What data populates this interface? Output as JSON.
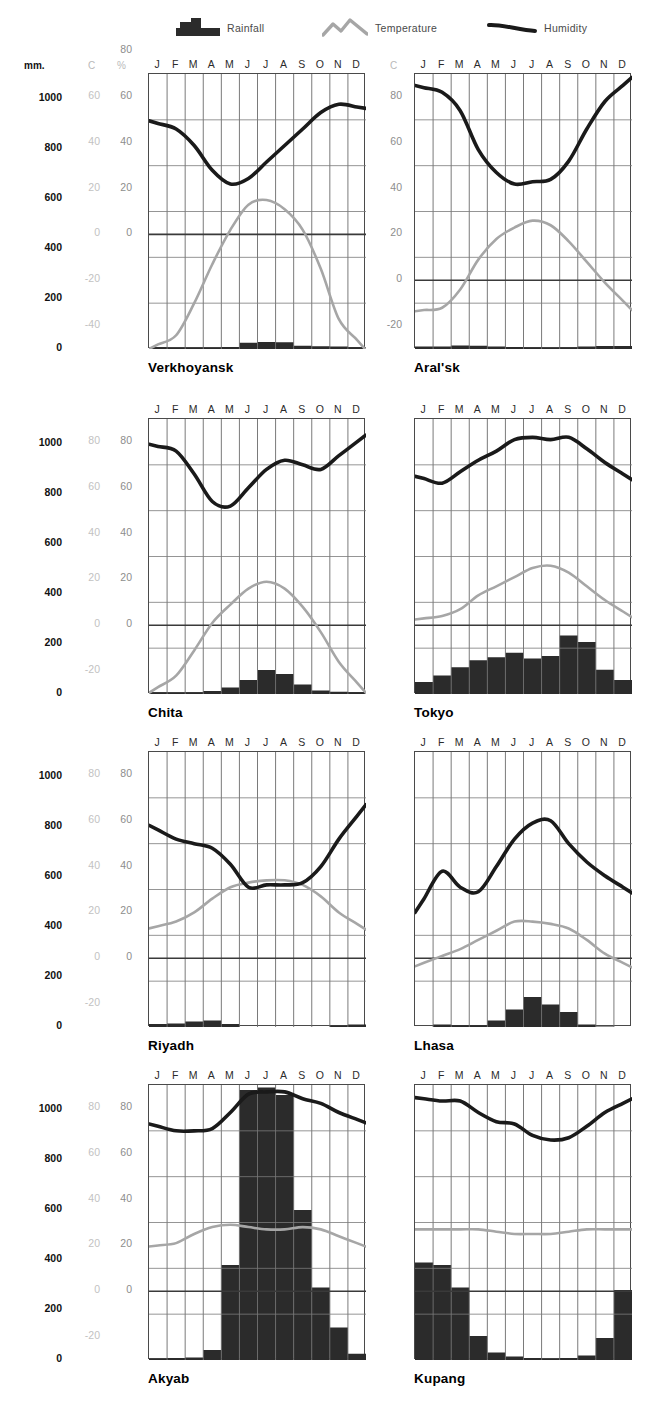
{
  "legend": {
    "rainfall": {
      "label": "Rainfall",
      "icon": "rainfall-bars-icon",
      "color": "#2b2b2b"
    },
    "temperature": {
      "label": "Temperature",
      "icon": "temperature-peak-line-icon",
      "color": "#a6a6a6"
    },
    "humidity": {
      "label": "Humidity",
      "icon": "humidity-line-icon",
      "color": "#1a1a1a"
    }
  },
  "units": {
    "mm": "mm.",
    "c": "C",
    "percent": "%"
  },
  "months": [
    "J",
    "F",
    "M",
    "A",
    "M",
    "J",
    "J",
    "A",
    "S",
    "O",
    "N",
    "D"
  ],
  "axes": {
    "row1": {
      "mm": [
        "1000",
        "800",
        "600",
        "400",
        "200",
        "0"
      ],
      "c": [
        "60",
        "40",
        "20",
        "0",
        "-20",
        "-40"
      ],
      "percent": [
        "80",
        "60",
        "40",
        "20",
        "0"
      ]
    },
    "row_other": {
      "mm": [
        "1000",
        "800",
        "600",
        "400",
        "200",
        "0"
      ],
      "c": [
        "80",
        "60",
        "40",
        "20",
        "0",
        "-20"
      ],
      "percent": [
        "80",
        "60",
        "40",
        "20",
        "0"
      ]
    },
    "rightcol_c_row1": [
      "80",
      "60",
      "40",
      "20",
      "0",
      "-20"
    ]
  },
  "chart_data": [
    {
      "type": "line",
      "title": "Verkhoyansk",
      "categories": [
        "J",
        "F",
        "M",
        "A",
        "M",
        "J",
        "J",
        "A",
        "S",
        "O",
        "N",
        "D"
      ],
      "xlabel": "",
      "ylabel": "",
      "rain_ylim": [
        0,
        1100
      ],
      "temp_ylim": [
        -50,
        70
      ],
      "hum_ylim": [
        -10,
        90
      ],
      "grid": true,
      "series": [
        {
          "name": "Rainfall",
          "unit": "mm",
          "values": [
            7,
            5,
            5,
            5,
            8,
            25,
            28,
            27,
            13,
            11,
            10,
            7
          ]
        },
        {
          "name": "Temperature",
          "unit": "C",
          "values": [
            -48,
            -44,
            -30,
            -13,
            2,
            13,
            15,
            11,
            2,
            -15,
            -37,
            -46
          ]
        },
        {
          "name": "Humidity",
          "unit": "%",
          "values": [
            72,
            70,
            64,
            55,
            50,
            52,
            58,
            64,
            70,
            76,
            79,
            78
          ]
        }
      ]
    },
    {
      "type": "line",
      "title": "Aral'sk",
      "categories": [
        "J",
        "F",
        "M",
        "A",
        "M",
        "J",
        "J",
        "A",
        "S",
        "O",
        "N",
        "D"
      ],
      "xlabel": "",
      "ylabel": "",
      "rain_ylim": [
        0,
        1100
      ],
      "temp_ylim": [
        -30,
        90
      ],
      "hum_ylim": [
        -30,
        90
      ],
      "grid": true,
      "series": [
        {
          "name": "Rainfall",
          "unit": "mm",
          "values": [
            10,
            10,
            14,
            13,
            10,
            8,
            6,
            5,
            6,
            10,
            12,
            12
          ]
        },
        {
          "name": "Temperature",
          "unit": "C",
          "values": [
            -13,
            -12,
            -4,
            9,
            18,
            23,
            26,
            24,
            17,
            8,
            -1,
            -9
          ]
        },
        {
          "name": "Humidity",
          "unit": "%",
          "values": [
            84,
            82,
            74,
            57,
            47,
            42,
            43,
            44,
            52,
            66,
            78,
            85
          ]
        }
      ]
    },
    {
      "type": "line",
      "title": "Chita",
      "categories": [
        "J",
        "F",
        "M",
        "A",
        "M",
        "J",
        "J",
        "A",
        "S",
        "O",
        "N",
        "D"
      ],
      "xlabel": "",
      "ylabel": "",
      "rain_ylim": [
        0,
        1100
      ],
      "temp_ylim": [
        -30,
        90
      ],
      "hum_ylim": [
        -30,
        90
      ],
      "grid": true,
      "series": [
        {
          "name": "Rainfall",
          "unit": "mm",
          "values": [
            6,
            5,
            6,
            12,
            26,
            56,
            96,
            80,
            38,
            14,
            9,
            7
          ]
        },
        {
          "name": "Temperature",
          "unit": "C",
          "values": [
            -27,
            -22,
            -11,
            1,
            9,
            16,
            19,
            16,
            8,
            -3,
            -16,
            -25
          ]
        },
        {
          "name": "Humidity",
          "unit": "%",
          "values": [
            78,
            76,
            66,
            54,
            52,
            60,
            68,
            72,
            70,
            68,
            74,
            80
          ]
        }
      ]
    },
    {
      "type": "line",
      "title": "Tokyo",
      "categories": [
        "J",
        "F",
        "M",
        "A",
        "M",
        "J",
        "J",
        "A",
        "S",
        "O",
        "N",
        "D"
      ],
      "xlabel": "",
      "ylabel": "",
      "rain_ylim": [
        0,
        1100
      ],
      "temp_ylim": [
        -30,
        90
      ],
      "hum_ylim": [
        -30,
        90
      ],
      "grid": true,
      "series": [
        {
          "name": "Rainfall",
          "unit": "mm",
          "values": [
            48,
            74,
            107,
            135,
            147,
            165,
            142,
            152,
            234,
            208,
            97,
            56
          ]
        },
        {
          "name": "Temperature",
          "unit": "C",
          "values": [
            3,
            4,
            7,
            13,
            17,
            21,
            25,
            26,
            23,
            17,
            11,
            6
          ]
        },
        {
          "name": "Humidity",
          "unit": "%",
          "values": [
            64,
            62,
            67,
            72,
            76,
            81,
            82,
            81,
            82,
            77,
            71,
            66
          ]
        }
      ]
    },
    {
      "type": "line",
      "title": "Riyadh",
      "categories": [
        "J",
        "F",
        "M",
        "A",
        "M",
        "J",
        "J",
        "A",
        "S",
        "O",
        "N",
        "D"
      ],
      "xlabel": "",
      "ylabel": "",
      "rain_ylim": [
        0,
        1100
      ],
      "temp_ylim": [
        -30,
        90
      ],
      "hum_ylim": [
        -30,
        90
      ],
      "grid": true,
      "series": [
        {
          "name": "Rainfall",
          "unit": "mm",
          "values": [
            12,
            14,
            22,
            26,
            12,
            0,
            0,
            0,
            0,
            0,
            6,
            10
          ]
        },
        {
          "name": "Temperature",
          "unit": "C",
          "values": [
            14,
            16,
            20,
            26,
            31,
            33,
            34,
            34,
            32,
            27,
            20,
            15
          ]
        },
        {
          "name": "Humidity",
          "unit": "%",
          "values": [
            56,
            52,
            50,
            48,
            41,
            31,
            32,
            32,
            33,
            40,
            52,
            62
          ]
        }
      ]
    },
    {
      "type": "line",
      "title": "Lhasa",
      "categories": [
        "J",
        "F",
        "M",
        "A",
        "M",
        "J",
        "J",
        "A",
        "S",
        "O",
        "N",
        "D"
      ],
      "xlabel": "",
      "ylabel": "",
      "rain_ylim": [
        0,
        1100
      ],
      "temp_ylim": [
        -30,
        90
      ],
      "hum_ylim": [
        -30,
        90
      ],
      "grid": true,
      "series": [
        {
          "name": "Rainfall",
          "unit": "mm",
          "values": [
            0,
            10,
            7,
            7,
            26,
            70,
            120,
            90,
            60,
            10,
            2,
            0
          ]
        },
        {
          "name": "Temperature",
          "unit": "C",
          "values": [
            -2,
            1,
            4,
            8,
            12,
            16,
            16,
            15,
            13,
            8,
            2,
            -2
          ]
        },
        {
          "name": "Humidity",
          "unit": "%",
          "values": [
            26,
            38,
            31,
            29,
            40,
            52,
            59,
            60,
            50,
            42,
            36,
            31
          ]
        }
      ]
    },
    {
      "type": "line",
      "title": "Akyab",
      "categories": [
        "J",
        "F",
        "M",
        "A",
        "M",
        "J",
        "J",
        "A",
        "S",
        "O",
        "N",
        "D"
      ],
      "xlabel": "",
      "ylabel": "",
      "rain_ylim": [
        0,
        1100
      ],
      "temp_ylim": [
        -30,
        90
      ],
      "hum_ylim": [
        -30,
        90
      ],
      "grid": true,
      "series": [
        {
          "name": "Rainfall",
          "unit": "mm",
          "values": [
            5,
            8,
            10,
            40,
            380,
            1080,
            1090,
            1060,
            600,
            290,
            130,
            25
          ]
        },
        {
          "name": "Temperature",
          "unit": "C",
          "values": [
            20,
            21,
            25,
            28,
            29,
            28,
            27,
            27,
            28,
            27,
            24,
            21
          ]
        },
        {
          "name": "Humidity",
          "unit": "%",
          "values": [
            72,
            70,
            70,
            71,
            78,
            86,
            87,
            87,
            84,
            82,
            78,
            75
          ]
        }
      ]
    },
    {
      "type": "line",
      "title": "Kupang",
      "categories": [
        "J",
        "F",
        "M",
        "A",
        "M",
        "J",
        "J",
        "A",
        "S",
        "O",
        "N",
        "D"
      ],
      "xlabel": "",
      "ylabel": "",
      "rain_ylim": [
        0,
        1100
      ],
      "temp_ylim": [
        -30,
        90
      ],
      "hum_ylim": [
        -30,
        90
      ],
      "grid": true,
      "series": [
        {
          "name": "Rainfall",
          "unit": "mm",
          "values": [
            390,
            380,
            290,
            96,
            30,
            14,
            8,
            5,
            8,
            18,
            88,
            280
          ]
        },
        {
          "name": "Temperature",
          "unit": "C",
          "values": [
            27,
            27,
            27,
            27,
            26,
            25,
            25,
            25,
            26,
            27,
            27,
            27
          ]
        },
        {
          "name": "Humidity",
          "unit": "%",
          "values": [
            84,
            83,
            83,
            78,
            74,
            73,
            68,
            66,
            67,
            72,
            78,
            82
          ]
        }
      ]
    }
  ]
}
